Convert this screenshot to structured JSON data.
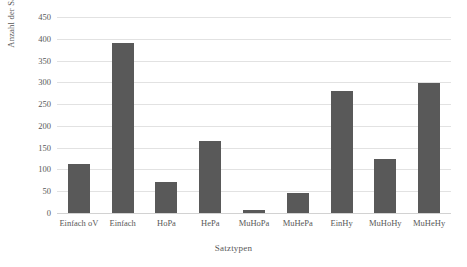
{
  "chart_data": {
    "type": "bar",
    "title": "",
    "xlabel": "Satztypen",
    "ylabel": "Anzahl der Sätze",
    "categories": [
      "Einfach oV",
      "Einfach",
      "HoPa",
      "HePa",
      "MuHoPa",
      "MuHePa",
      "EinHy",
      "MuHoHy",
      "MuHeHy"
    ],
    "values": [
      113,
      390,
      72,
      165,
      8,
      45,
      280,
      125,
      298
    ],
    "ylim": [
      0,
      450
    ],
    "ytick_labels": [
      "0",
      "50",
      "100",
      "150",
      "200",
      "250",
      "300",
      "350",
      "400",
      "450"
    ],
    "ytick_values": [
      0,
      50,
      100,
      150,
      200,
      250,
      300,
      350,
      400,
      450
    ],
    "ytick_step": 50,
    "grid": true,
    "legend": false,
    "legend_position": "none",
    "bar_color": "#595959",
    "gridline_color": "#e2e2e2",
    "axis_text_color": "#585858",
    "background_color": "#ffffff"
  }
}
